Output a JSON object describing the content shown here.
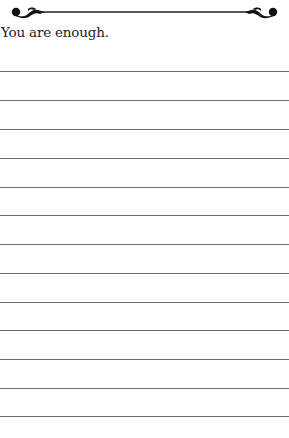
{
  "page": {
    "prompt": "You are enough.",
    "ruled_line_count": 13,
    "ruled_line_positions": [
      71,
      100,
      129,
      158,
      187,
      215,
      244,
      273,
      302,
      330,
      359,
      388,
      416
    ],
    "line_color": "#6b6b6b",
    "ornament": "flourish-divider",
    "page_numbers": {
      "left": "",
      "right": ""
    }
  }
}
